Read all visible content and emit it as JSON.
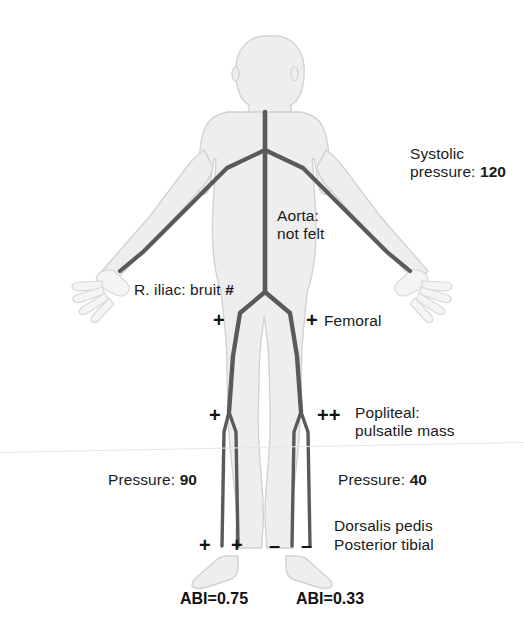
{
  "figure": {
    "colors": {
      "background": "#ffffff",
      "body_fill": "#eeeeee",
      "body_outline": "#d2d2d2",
      "artery": "#5a5a5a",
      "text": "#1a1a1a",
      "scanline": "#e9e6e2"
    }
  },
  "annotations": {
    "systolic": {
      "line1": "Systolic",
      "line2_prefix": "pressure: ",
      "line2_value": "120"
    },
    "aorta": {
      "line1": "Aorta:",
      "line2": "not felt"
    },
    "iliac": {
      "label": "R. iliac: bruit ",
      "marker": "#"
    },
    "femoral": {
      "label": "Femoral",
      "left_marker": "+",
      "right_marker": "+"
    },
    "popliteal": {
      "line1": "Popliteal:",
      "line2": "pulsatile mass",
      "left_marker": "+",
      "right_marker": "++"
    },
    "pressure_left": {
      "prefix": "Pressure: ",
      "value": "90"
    },
    "pressure_right": {
      "prefix": "Pressure: ",
      "value": "40"
    },
    "pedal": {
      "dorsalis_pedis": "Dorsalis pedis",
      "posterior_tibial": "Posterior tibial",
      "left_dp_marker": "+",
      "left_pt_marker": "+",
      "right_dp_marker": "–",
      "right_pt_marker": "–"
    },
    "abi_left": "ABI=0.75",
    "abi_right": "ABI=0.33"
  }
}
